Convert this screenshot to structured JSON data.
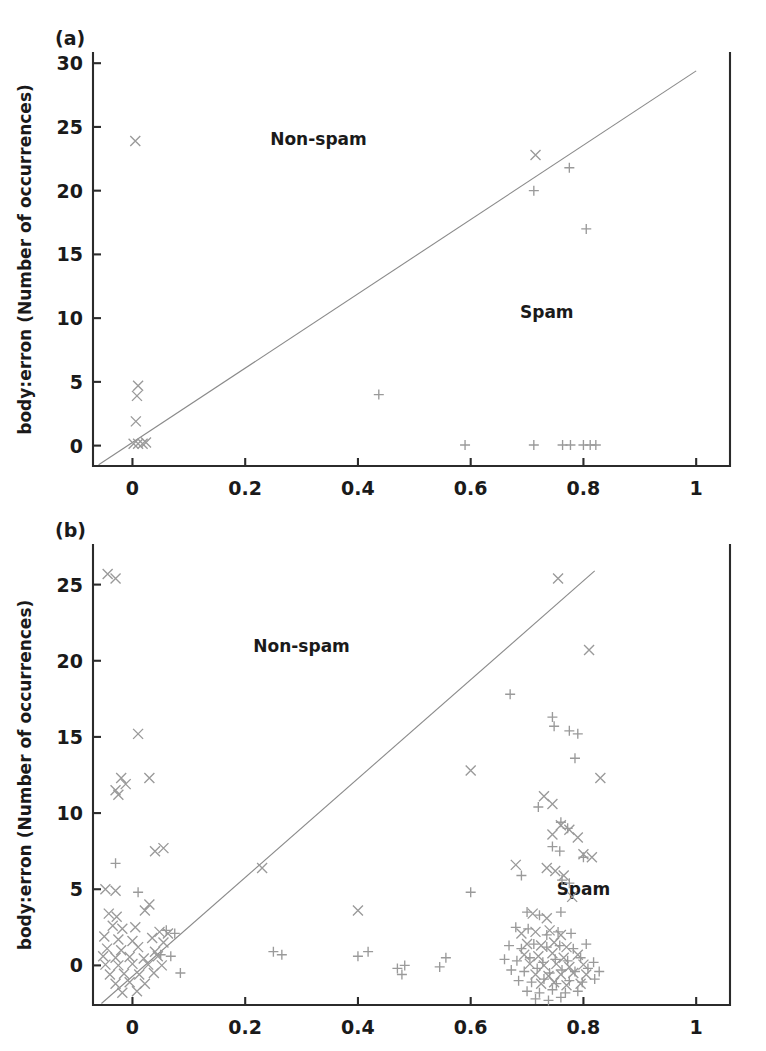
{
  "figure": {
    "background": "#ffffff",
    "marker_color": "#9a9a9a",
    "axis_color": "#2b2b2b",
    "line_color": "#8a8a8a"
  },
  "panels": [
    {
      "id": "panel-a",
      "label": "(a)",
      "ylabel": "body:erron (Number of occurrences)",
      "xlabel": "",
      "region_labels": [
        {
          "text": "Non-spam",
          "x": 0.33,
          "y": 23.6
        },
        {
          "text": "Spam",
          "x": 0.735,
          "y": 10.0
        }
      ]
    },
    {
      "id": "panel-b",
      "label": "(b)",
      "ylabel": "body:erron (Number of occurrences)",
      "xlabel": "",
      "region_labels": [
        {
          "text": "Non-spam",
          "x": 0.3,
          "y": 20.6
        },
        {
          "text": "Spam",
          "x": 0.8,
          "y": 4.6
        }
      ]
    }
  ],
  "chart_data": [
    {
      "type": "scatter",
      "panel": "(a)",
      "title": "",
      "xlabel": "",
      "ylabel": "body:erron (Number of occurrences)",
      "xlim": [
        -0.07,
        1.06
      ],
      "ylim": [
        -1.6,
        30.8
      ],
      "xticks": [
        0,
        0.2,
        0.4,
        0.6,
        0.8,
        1
      ],
      "xticklabels": [
        "0",
        "0.2",
        "0.4",
        "0.6",
        "0.8",
        "1"
      ],
      "yticks": [
        0,
        5,
        10,
        15,
        20,
        25,
        30
      ],
      "yticklabels": [
        "0",
        "5",
        "10",
        "15",
        "20",
        "25",
        "30"
      ],
      "grid": false,
      "legend": "none",
      "annotations": [
        "Non-spam",
        "Spam"
      ],
      "reference_line": {
        "from": [
          -0.06,
          -1.5
        ],
        "to": [
          1.0,
          29.4
        ],
        "style": "solid"
      },
      "series": [
        {
          "name": "non-spam",
          "marker": "x",
          "points": [
            [
              0.005,
              23.9
            ],
            [
              0.01,
              4.7
            ],
            [
              0.008,
              3.9
            ],
            [
              0.006,
              1.9
            ],
            [
              0.002,
              0.15
            ],
            [
              0.01,
              0.15
            ],
            [
              0.018,
              0.15
            ],
            [
              0.024,
              0.25
            ],
            [
              0.715,
              22.8
            ]
          ]
        },
        {
          "name": "spam",
          "marker": "+",
          "points": [
            [
              0.775,
              21.8
            ],
            [
              0.712,
              20.0
            ],
            [
              0.805,
              17.0
            ],
            [
              0.437,
              4.0
            ],
            [
              0.59,
              0.05
            ],
            [
              0.712,
              0.05
            ],
            [
              0.763,
              0.05
            ],
            [
              0.777,
              0.05
            ],
            [
              0.8,
              0.05
            ],
            [
              0.812,
              0.05
            ],
            [
              0.822,
              0.05
            ]
          ]
        }
      ]
    },
    {
      "type": "scatter",
      "panel": "(b)",
      "title": "",
      "xlabel": "",
      "ylabel": "body:erron (Number of occurrences)",
      "xlim": [
        -0.07,
        1.06
      ],
      "ylim": [
        -2.6,
        27.6
      ],
      "xticks": [
        0,
        0.2,
        0.4,
        0.6,
        0.8,
        1
      ],
      "xticklabels": [
        "0",
        "0.2",
        "0.4",
        "0.6",
        "0.8",
        "1"
      ],
      "yticks": [
        0,
        5,
        10,
        15,
        20,
        25
      ],
      "yticklabels": [
        "0",
        "5",
        "10",
        "15",
        "20",
        "25"
      ],
      "grid": false,
      "legend": "none",
      "annotations": [
        "Non-spam",
        "Spam"
      ],
      "reference_line": {
        "from": [
          -0.055,
          -2.5
        ],
        "to": [
          0.82,
          25.9
        ],
        "style": "solid"
      },
      "series": [
        {
          "name": "non-spam",
          "marker": "x",
          "points": [
            [
              -0.044,
              25.7
            ],
            [
              -0.03,
              25.4
            ],
            [
              0.01,
              15.2
            ],
            [
              -0.02,
              12.3
            ],
            [
              -0.012,
              11.9
            ],
            [
              -0.03,
              11.5
            ],
            [
              -0.025,
              11.2
            ],
            [
              0.03,
              12.3
            ],
            [
              0.055,
              7.7
            ],
            [
              0.04,
              7.5
            ],
            [
              -0.048,
              5.0
            ],
            [
              -0.03,
              4.9
            ],
            [
              0.03,
              4.0
            ],
            [
              -0.042,
              3.4
            ],
            [
              -0.028,
              3.2
            ],
            [
              0.022,
              3.6
            ],
            [
              -0.035,
              2.6
            ],
            [
              -0.018,
              2.4
            ],
            [
              0.005,
              2.5
            ],
            [
              0.048,
              2.2
            ],
            [
              0.063,
              2.1
            ],
            [
              -0.05,
              1.9
            ],
            [
              -0.025,
              1.7
            ],
            [
              0.0,
              1.6
            ],
            [
              0.035,
              1.8
            ],
            [
              0.055,
              1.5
            ],
            [
              -0.045,
              1.1
            ],
            [
              -0.02,
              1.0
            ],
            [
              0.01,
              1.2
            ],
            [
              0.04,
              0.9
            ],
            [
              -0.052,
              0.6
            ],
            [
              -0.03,
              0.5
            ],
            [
              -0.005,
              0.55
            ],
            [
              0.02,
              0.45
            ],
            [
              0.045,
              0.6
            ],
            [
              -0.048,
              0.05
            ],
            [
              -0.025,
              0.0
            ],
            [
              0.0,
              0.1
            ],
            [
              0.028,
              0.05
            ],
            [
              0.052,
              0.0
            ],
            [
              -0.04,
              -0.6
            ],
            [
              -0.015,
              -0.55
            ],
            [
              0.012,
              -0.6
            ],
            [
              0.038,
              -0.5
            ],
            [
              -0.03,
              -1.2
            ],
            [
              -0.005,
              -1.1
            ],
            [
              0.022,
              -1.2
            ],
            [
              -0.018,
              -1.8
            ],
            [
              0.008,
              -1.7
            ],
            [
              0.23,
              6.4
            ],
            [
              0.4,
              3.6
            ],
            [
              0.6,
              12.8
            ],
            [
              0.68,
              6.6
            ],
            [
              0.755,
              25.4
            ],
            [
              0.81,
              20.7
            ],
            [
              0.83,
              12.3
            ],
            [
              0.73,
              11.1
            ],
            [
              0.745,
              10.6
            ],
            [
              0.76,
              9.2
            ],
            [
              0.775,
              8.9
            ],
            [
              0.79,
              8.4
            ],
            [
              0.745,
              8.6
            ],
            [
              0.8,
              7.3
            ],
            [
              0.815,
              7.1
            ],
            [
              0.735,
              6.4
            ],
            [
              0.75,
              6.2
            ],
            [
              0.765,
              5.9
            ],
            [
              0.78,
              4.5
            ],
            [
              0.71,
              3.4
            ],
            [
              0.735,
              3.1
            ],
            [
              0.69,
              2.1
            ],
            [
              0.715,
              2.2
            ],
            [
              0.74,
              2.3
            ],
            [
              0.76,
              2.0
            ],
            [
              0.7,
              1.4
            ],
            [
              0.725,
              1.3
            ],
            [
              0.748,
              1.5
            ],
            [
              0.77,
              1.2
            ],
            [
              0.695,
              0.7
            ],
            [
              0.72,
              0.6
            ],
            [
              0.745,
              0.8
            ],
            [
              0.765,
              0.5
            ],
            [
              0.79,
              0.7
            ],
            [
              0.705,
              0.1
            ],
            [
              0.73,
              0.0
            ],
            [
              0.752,
              0.1
            ],
            [
              0.775,
              -0.1
            ],
            [
              0.8,
              0.05
            ],
            [
              0.715,
              -0.6
            ],
            [
              0.738,
              -0.7
            ],
            [
              0.76,
              -0.6
            ],
            [
              0.782,
              -0.5
            ],
            [
              0.805,
              -0.6
            ],
            [
              0.725,
              -1.2
            ],
            [
              0.748,
              -1.1
            ],
            [
              0.77,
              -1.3
            ],
            [
              0.795,
              -1.2
            ]
          ]
        },
        {
          "name": "spam",
          "marker": "+",
          "points": [
            [
              -0.03,
              6.7
            ],
            [
              0.01,
              4.8
            ],
            [
              0.06,
              2.3
            ],
            [
              0.075,
              2.1
            ],
            [
              0.05,
              0.7
            ],
            [
              0.068,
              0.6
            ],
            [
              0.085,
              -0.5
            ],
            [
              0.25,
              0.9
            ],
            [
              0.265,
              0.7
            ],
            [
              0.4,
              0.6
            ],
            [
              0.418,
              0.9
            ],
            [
              0.47,
              -0.2
            ],
            [
              0.483,
              0.0
            ],
            [
              0.478,
              -0.6
            ],
            [
              0.545,
              -0.1
            ],
            [
              0.556,
              0.5
            ],
            [
              0.6,
              4.8
            ],
            [
              0.67,
              17.8
            ],
            [
              0.745,
              16.3
            ],
            [
              0.748,
              15.7
            ],
            [
              0.775,
              15.4
            ],
            [
              0.79,
              15.2
            ],
            [
              0.785,
              13.6
            ],
            [
              0.72,
              10.4
            ],
            [
              0.76,
              9.4
            ],
            [
              0.772,
              9.0
            ],
            [
              0.745,
              7.8
            ],
            [
              0.758,
              7.5
            ],
            [
              0.8,
              7.1
            ],
            [
              0.69,
              5.9
            ],
            [
              0.762,
              5.6
            ],
            [
              0.775,
              5.4
            ],
            [
              0.7,
              3.5
            ],
            [
              0.722,
              3.3
            ],
            [
              0.76,
              3.5
            ],
            [
              0.68,
              2.5
            ],
            [
              0.702,
              2.4
            ],
            [
              0.735,
              2.0
            ],
            [
              0.755,
              2.2
            ],
            [
              0.778,
              2.1
            ],
            [
              0.668,
              1.3
            ],
            [
              0.69,
              1.1
            ],
            [
              0.712,
              1.4
            ],
            [
              0.735,
              1.2
            ],
            [
              0.758,
              1.3
            ],
            [
              0.782,
              1.1
            ],
            [
              0.805,
              1.4
            ],
            [
              0.66,
              0.4
            ],
            [
              0.682,
              0.3
            ],
            [
              0.705,
              0.5
            ],
            [
              0.728,
              0.2
            ],
            [
              0.75,
              0.4
            ],
            [
              0.772,
              0.3
            ],
            [
              0.795,
              0.5
            ],
            [
              0.818,
              0.2
            ],
            [
              0.672,
              -0.3
            ],
            [
              0.695,
              -0.4
            ],
            [
              0.718,
              -0.2
            ],
            [
              0.74,
              -0.5
            ],
            [
              0.762,
              -0.3
            ],
            [
              0.785,
              -0.4
            ],
            [
              0.808,
              -0.2
            ],
            [
              0.828,
              -0.4
            ],
            [
              0.685,
              -1.0
            ],
            [
              0.708,
              -1.1
            ],
            [
              0.73,
              -0.9
            ],
            [
              0.752,
              -1.2
            ],
            [
              0.775,
              -1.0
            ],
            [
              0.798,
              -1.1
            ],
            [
              0.82,
              -0.9
            ],
            [
              0.7,
              -1.7
            ],
            [
              0.722,
              -1.8
            ],
            [
              0.745,
              -1.6
            ],
            [
              0.768,
              -1.8
            ],
            [
              0.79,
              -1.7
            ],
            [
              0.715,
              -2.2
            ],
            [
              0.738,
              -2.3
            ],
            [
              0.76,
              -2.1
            ]
          ]
        }
      ]
    }
  ]
}
